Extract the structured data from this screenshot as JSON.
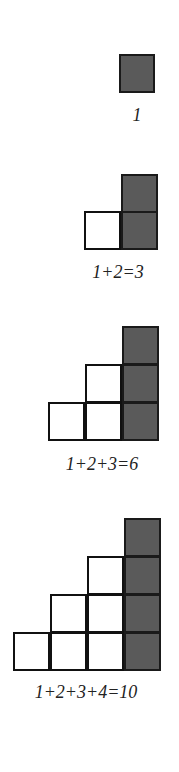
{
  "figure": {
    "colors": {
      "shaded": "#5a5a5a",
      "outline": "#111111",
      "blank": "#ffffff"
    },
    "groups": [
      {
        "label": "1",
        "rows": 1,
        "total": 1
      },
      {
        "label": "1+2=3",
        "rows": 2,
        "total": 3
      },
      {
        "label": "1+2+3=6",
        "rows": 3,
        "total": 6
      },
      {
        "label": "1+2+3+4=10",
        "rows": 4,
        "total": 10
      }
    ]
  }
}
